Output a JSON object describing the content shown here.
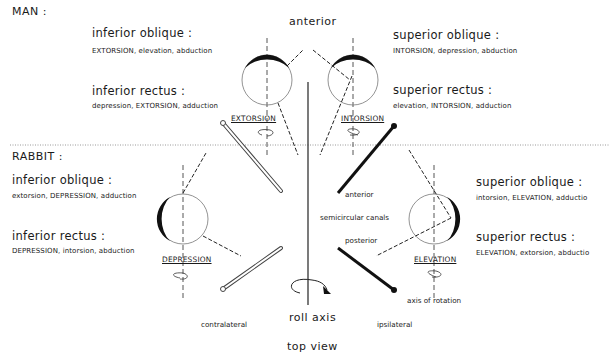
{
  "view_label": "top view",
  "axis_label": "roll axis",
  "anterior_label": "anterior",
  "man": {
    "title": "MAN :",
    "muscles": [
      {
        "name": "inferior oblique :",
        "actions": "EXTORSION, elevation, abduction"
      },
      {
        "name": "inferior rectus :",
        "actions": "depression, EXTORSION, adduction"
      },
      {
        "name": "superior oblique :",
        "actions": "INTORSION, depression, abduction"
      },
      {
        "name": "superior rectus :",
        "actions": "elevation, INTORSION, adduction"
      }
    ],
    "eye_left_result": "EXTORSION",
    "eye_right_result": "INTORSION"
  },
  "rabbit": {
    "title": "RABBIT :",
    "muscles": [
      {
        "name": "inferior oblique :",
        "actions": "extorsion, DEPRESSION, adduction"
      },
      {
        "name": "inferior rectus :",
        "actions": "DEPRESSION, intorsion, abduction"
      },
      {
        "name": "superior oblique :",
        "actions": "intorsion, ELEVATION, adductio"
      },
      {
        "name": "superior rectus :",
        "actions": "ELEVATION, extorsion, abductio"
      }
    ],
    "eye_left_result": "DEPRESSION",
    "eye_right_result": "ELEVATION"
  },
  "canals": {
    "title": "semicircular canals",
    "anterior": "anterior",
    "posterior": "posterior",
    "contralateral": "contralateral",
    "ipsilateral": "ipsilateral",
    "axis_of_rotation": "axis of rotation"
  }
}
